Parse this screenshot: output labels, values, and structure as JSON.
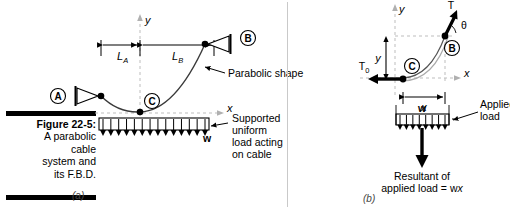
{
  "figure": {
    "caption_title": "Figure 22-5:",
    "caption_lines": [
      "A parabolic",
      "cable",
      "system and",
      "its F.B.D."
    ],
    "sublabel_a": "(a)",
    "sublabel_b": "(b)"
  },
  "diagram_a": {
    "title_role": "parabolic-cable-system",
    "support_a_label": "A",
    "support_b_label": "B",
    "point_c_label": "C",
    "dim_la_label": "L",
    "dim_la_sub": "A",
    "dim_lb_label": "L",
    "dim_lb_sub": "B",
    "axis_x_label": "x",
    "axis_y_label": "y",
    "load_symbol": "w",
    "callout_parabolic": "Parabolic shape",
    "callout_load_lines": [
      "Supported",
      "uniform",
      "load acting",
      "on cable"
    ],
    "load_arrow_count": 14
  },
  "diagram_b": {
    "title_role": "free-body-diagram",
    "point_b_label": "B",
    "point_c_label": "C",
    "tension_t_label": "T",
    "tension_t0_label": "T",
    "tension_t0_sub": "0",
    "angle_label": "θ",
    "dim_x_label": "x",
    "dim_y_label": "y",
    "axis_x_label": "x",
    "axis_y_label": "y",
    "load_symbol": "w",
    "callout_applied_lines": [
      "Applied",
      "load"
    ],
    "resultant_lines": [
      "Resultant of",
      "applied load = w",
      "x"
    ],
    "resultant_line1": "Resultant of",
    "resultant_line2_prefix": "applied load = w",
    "resultant_line2_italic": "x",
    "load_arrow_count": 8
  },
  "colors": {
    "ink": "#000000",
    "guide": "#bdbdbd",
    "cable": "#3a3a3a",
    "caption_rule": "#000000"
  }
}
